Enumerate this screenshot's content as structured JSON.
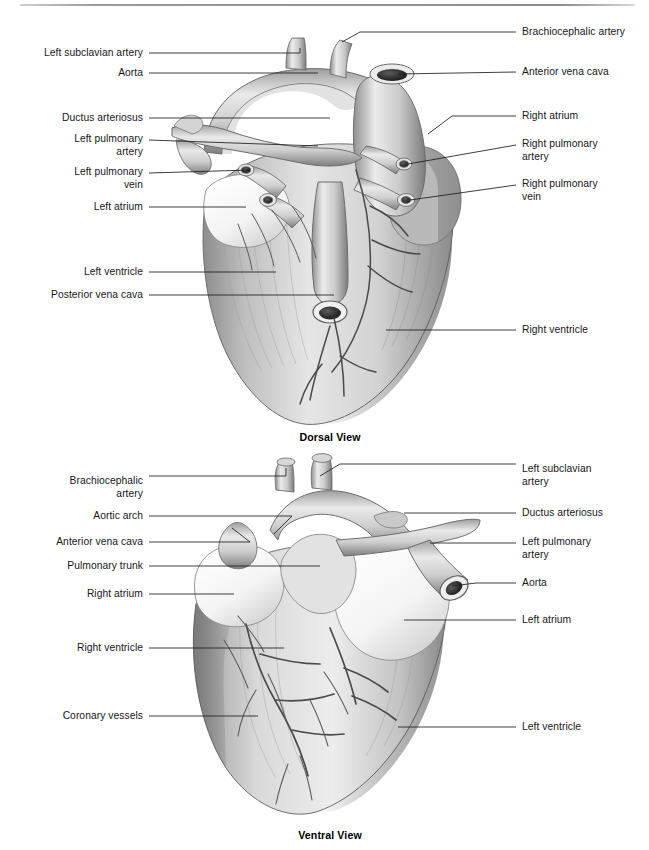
{
  "page": {
    "width": 649,
    "height": 850,
    "background": "#ffffff",
    "rule_color": "#8e8e8e",
    "text_color": "#17181a",
    "title_hint": "Mammalian heart anatomy, dorsal and ventral views"
  },
  "figures": [
    {
      "id": "dorsal",
      "caption": "Dorsal View",
      "caption_x": 330,
      "caption_y": 437,
      "labels_left": [
        {
          "text": "Left subclavian artery",
          "x": 143,
          "y": 53
        },
        {
          "text": "Aorta",
          "x": 143,
          "y": 73
        },
        {
          "text": "Ductus arteriosus",
          "x": 143,
          "y": 118
        },
        {
          "text": "Left pulmonary\nartery",
          "x": 143,
          "y": 140
        },
        {
          "text": "Left pulmonary\nvein",
          "x": 143,
          "y": 173
        },
        {
          "text": "Left atrium",
          "x": 143,
          "y": 207
        },
        {
          "text": "Left ventricle",
          "x": 143,
          "y": 272
        },
        {
          "text": "Posterior vena cava",
          "x": 143,
          "y": 295
        }
      ],
      "labels_right": [
        {
          "text": "Brachiocephalic artery",
          "x": 522,
          "y": 32
        },
        {
          "text": "Anterior vena cava",
          "x": 522,
          "y": 72
        },
        {
          "text": "Right atrium",
          "x": 522,
          "y": 116
        },
        {
          "text": "Right pulmonary\nartery",
          "x": 522,
          "y": 145
        },
        {
          "text": "Right pulmonary\nvein",
          "x": 522,
          "y": 185
        },
        {
          "text": "Right ventricle",
          "x": 522,
          "y": 330
        }
      ]
    },
    {
      "id": "ventral",
      "caption": "Ventral View",
      "caption_x": 330,
      "caption_y": 835,
      "labels_left": [
        {
          "text": "Brachiocephalic\nartery",
          "x": 143,
          "y": 482
        },
        {
          "text": "Aortic arch",
          "x": 143,
          "y": 516
        },
        {
          "text": "Anterior vena cava",
          "x": 143,
          "y": 542
        },
        {
          "text": "Pulmonary trunk",
          "x": 143,
          "y": 566
        },
        {
          "text": "Right atrium",
          "x": 143,
          "y": 594
        },
        {
          "text": "Right ventricle",
          "x": 143,
          "y": 648
        },
        {
          "text": "Coronary vessels",
          "x": 143,
          "y": 716
        }
      ],
      "labels_right": [
        {
          "text": "Left subclavian\nartery",
          "x": 522,
          "y": 470
        },
        {
          "text": "Ductus arteriosus",
          "x": 522,
          "y": 513
        },
        {
          "text": "Left pulmonary\nartery",
          "x": 522,
          "y": 543
        },
        {
          "text": "Aorta",
          "x": 522,
          "y": 583
        },
        {
          "text": "Left atrium",
          "x": 522,
          "y": 620
        },
        {
          "text": "Left ventricle",
          "x": 522,
          "y": 727
        }
      ]
    }
  ],
  "structures_depicted": [
    "Left subclavian artery",
    "Aorta",
    "Ductus arteriosus",
    "Left pulmonary artery",
    "Left pulmonary vein",
    "Left atrium",
    "Left ventricle",
    "Posterior vena cava",
    "Brachiocephalic artery",
    "Anterior vena cava",
    "Right atrium",
    "Right pulmonary artery",
    "Right pulmonary vein",
    "Right ventricle",
    "Aortic arch",
    "Pulmonary trunk",
    "Coronary vessels"
  ]
}
